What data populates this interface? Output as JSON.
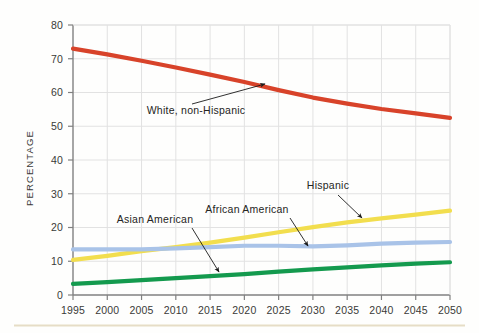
{
  "figure": {
    "background_color": "#fefefd",
    "footer_rule_color": "#e6ddc6",
    "grid_color": "#e2e2e2",
    "axis_color": "#808080"
  },
  "chart_data": {
    "type": "line",
    "title": "",
    "xlabel": "",
    "ylabel": "PERCENTAGE",
    "xlim": [
      1995,
      2050
    ],
    "ylim": [
      0,
      80
    ],
    "grid": true,
    "legend_position": "inline-annotations",
    "x": [
      1995,
      2000,
      2005,
      2010,
      2015,
      2020,
      2025,
      2030,
      2035,
      2040,
      2045,
      2050
    ],
    "xtick_labels": [
      "1995",
      "2000",
      "2005",
      "2010",
      "2015",
      "2020",
      "2025",
      "2030",
      "2035",
      "2040",
      "2045",
      "2050"
    ],
    "ytick_labels": [
      "0",
      "10",
      "20",
      "30",
      "40",
      "50",
      "60",
      "70",
      "80"
    ],
    "yticks": [
      0,
      10,
      20,
      30,
      40,
      50,
      60,
      70,
      80
    ],
    "series": [
      {
        "name": "White, non-Hispanic",
        "color": "#d8432a",
        "values": [
          73.0,
          71.3,
          69.4,
          67.4,
          65.3,
          63.1,
          60.7,
          58.5,
          56.7,
          55.1,
          53.8,
          52.5
        ]
      },
      {
        "name": "Hispanic",
        "color": "#f2de4e",
        "values": [
          10.4,
          11.6,
          13.0,
          14.2,
          15.5,
          17.0,
          18.6,
          20.1,
          21.5,
          22.7,
          23.8,
          25.0
        ]
      },
      {
        "name": "African American",
        "color": "#a9c3e8",
        "values": [
          13.5,
          13.5,
          13.5,
          13.8,
          14.2,
          14.6,
          14.6,
          14.4,
          14.7,
          15.2,
          15.5,
          15.7
        ]
      },
      {
        "name": "Asian American",
        "color": "#149a4e",
        "values": [
          3.3,
          3.8,
          4.4,
          5.0,
          5.6,
          6.2,
          6.9,
          7.6,
          8.2,
          8.8,
          9.3,
          9.7
        ]
      }
    ],
    "annotations": [
      {
        "label": "White, non-Hispanic",
        "text_x": 196,
        "text_y": 114,
        "arrow_from_x": 192,
        "arrow_from_y": 104,
        "arrow_to_x": 265,
        "arrow_to_y": 84
      },
      {
        "label": "Asian American",
        "text_x": 155,
        "text_y": 223,
        "arrow_from_x": 192,
        "arrow_from_y": 228,
        "arrow_to_x": 219,
        "arrow_to_y": 272
      },
      {
        "label": "African American",
        "text_x": 247,
        "text_y": 213,
        "arrow_from_x": 290,
        "arrow_from_y": 218,
        "arrow_to_x": 308,
        "arrow_to_y": 246
      },
      {
        "label": "Hispanic",
        "text_x": 328,
        "text_y": 189,
        "arrow_from_x": 338,
        "arrow_from_y": 195,
        "arrow_to_x": 362,
        "arrow_to_y": 218
      }
    ]
  }
}
